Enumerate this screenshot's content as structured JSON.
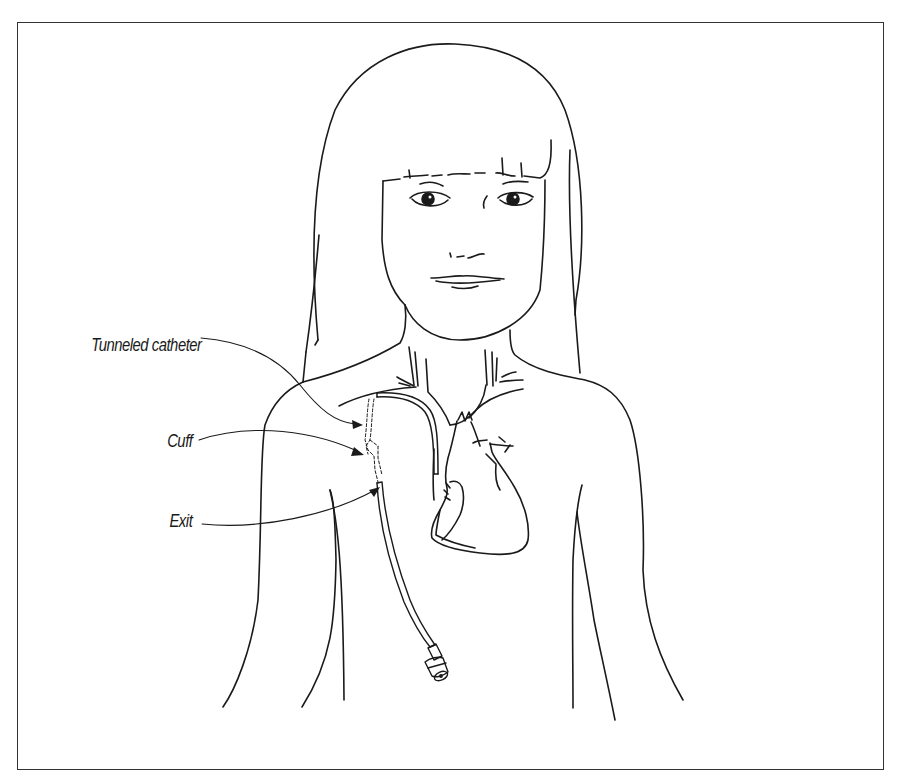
{
  "figure": {
    "labels": [
      {
        "id": "tunneled",
        "text": "Tunneled catheter"
      },
      {
        "id": "cuff",
        "text": "Cuff"
      },
      {
        "id": "exit",
        "text": "Exit"
      }
    ]
  },
  "colors": {
    "line": "#1a1a1a",
    "border": "#333333",
    "background": "#ffffff"
  }
}
